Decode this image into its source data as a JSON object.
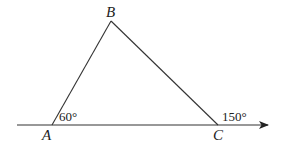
{
  "figure": {
    "type": "triangle-exterior-angle",
    "points": {
      "A": {
        "label": "A",
        "x": 52,
        "y": 125
      },
      "B": {
        "label": "B",
        "x": 111,
        "y": 21
      },
      "C": {
        "label": "C",
        "x": 218,
        "y": 125
      }
    },
    "baseline": {
      "x1": 17,
      "y1": 125,
      "x2": 268,
      "y2": 125,
      "arrow": "right"
    },
    "angles": {
      "at_A": {
        "label": "60°",
        "value": 60
      },
      "at_C_exterior": {
        "label": "150°",
        "value": 150
      }
    },
    "colors": {
      "stroke": "#333333",
      "text": "#222222",
      "background": "#ffffff"
    }
  }
}
